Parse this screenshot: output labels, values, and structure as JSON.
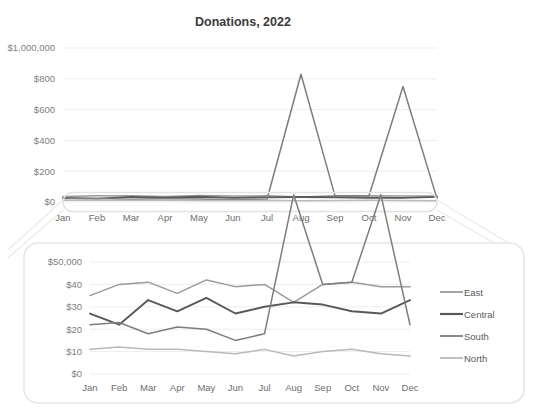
{
  "chart_data": [
    {
      "id": "overview",
      "type": "line",
      "title": "Donations, 2022",
      "xlabel": "",
      "ylabel": "",
      "grid": true,
      "legend_position": "none",
      "categories": [
        "Jan",
        "Feb",
        "Mar",
        "Apr",
        "May",
        "Jun",
        "Jul",
        "Aug",
        "Sep",
        "Oct",
        "Nov",
        "Dec"
      ],
      "ytick_labels": [
        "$1,000,000",
        "$800",
        "$600",
        "$400",
        "$200",
        "$0"
      ],
      "ytick_values": [
        1000,
        800,
        600,
        400,
        200,
        0
      ],
      "ylim": [
        0,
        1000
      ],
      "series": [
        {
          "name": "East",
          "color": "#9a9a9a",
          "values": [
            35,
            40,
            41,
            36,
            42,
            39,
            40,
            32,
            40,
            41,
            39,
            39
          ]
        },
        {
          "name": "Central",
          "color": "#595959",
          "values": [
            27,
            22,
            33,
            28,
            34,
            27,
            30,
            32,
            31,
            28,
            27,
            33
          ]
        },
        {
          "name": "South",
          "color": "#7d7d7d",
          "values": [
            22,
            23,
            18,
            21,
            20,
            15,
            18,
            830,
            40,
            41,
            750,
            22
          ]
        },
        {
          "name": "North",
          "color": "#b9b9b9",
          "values": [
            11,
            12,
            11,
            11,
            10,
            9,
            11,
            8,
            10,
            11,
            9,
            8
          ]
        }
      ]
    },
    {
      "id": "magnified",
      "type": "line",
      "title": "",
      "xlabel": "",
      "ylabel": "",
      "grid": true,
      "legend_position": "right",
      "categories": [
        "Jan",
        "Feb",
        "Mar",
        "Apr",
        "May",
        "Jun",
        "Jul",
        "Aug",
        "Sep",
        "Oct",
        "Nov",
        "Dec"
      ],
      "ytick_labels": [
        "$50,000",
        "$40",
        "$30",
        "$20",
        "$10",
        "$0"
      ],
      "ytick_values": [
        50,
        40,
        30,
        20,
        10,
        0
      ],
      "ylim": [
        0,
        50
      ],
      "series": [
        {
          "name": "East",
          "color": "#9a9a9a",
          "values": [
            35,
            40,
            41,
            36,
            42,
            39,
            40,
            32,
            40,
            41,
            39,
            39
          ]
        },
        {
          "name": "Central",
          "color": "#595959",
          "values": [
            27,
            22,
            33,
            28,
            34,
            27,
            30,
            32,
            31,
            28,
            27,
            33
          ]
        },
        {
          "name": "South",
          "color": "#7d7d7d",
          "values": [
            22,
            23,
            18,
            21,
            20,
            15,
            18,
            830,
            40,
            41,
            750,
            22
          ]
        },
        {
          "name": "North",
          "color": "#b9b9b9",
          "values": [
            11,
            12,
            11,
            11,
            10,
            9,
            11,
            8,
            10,
            11,
            9,
            8
          ]
        }
      ]
    }
  ],
  "overview": {
    "title": "Donations, 2022",
    "ytick_labels": [
      "$1,000,000",
      "$800",
      "$600",
      "$400",
      "$200",
      "$0"
    ],
    "xtick_labels": [
      "Jan",
      "Feb",
      "Mar",
      "Apr",
      "May",
      "Jun",
      "Jul",
      "Aug",
      "Sep",
      "Oct",
      "Nov",
      "Dec"
    ]
  },
  "magnifier": {
    "ytick_labels": [
      "$50,000",
      "$40",
      "$30",
      "$20",
      "$10",
      "$0"
    ],
    "xtick_labels": [
      "Jan",
      "Feb",
      "Mar",
      "Apr",
      "May",
      "Jun",
      "Jul",
      "Aug",
      "Sep",
      "Oct",
      "Nov",
      "Dec"
    ],
    "legend": [
      {
        "label": "East",
        "color": "#9a9a9a"
      },
      {
        "label": "Central",
        "color": "#595959"
      },
      {
        "label": "South",
        "color": "#7d7d7d"
      },
      {
        "label": "North",
        "color": "#b9b9b9"
      }
    ]
  },
  "colors": {
    "background": "#ffffff",
    "grid": "#e9e9e9",
    "title_text": "#3a3a3a",
    "axis_text": "#6e6e6e",
    "callout_stroke": "#e6e6e6"
  }
}
